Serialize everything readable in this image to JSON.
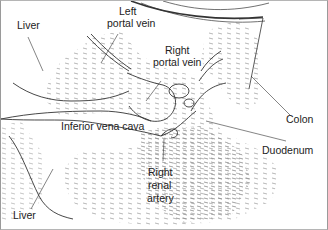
{
  "diagram": {
    "type": "anatomical-line-drawing",
    "colors": {
      "line": "#333333",
      "hatch": "#8a8a8a",
      "background": "#ffffff"
    },
    "labels": {
      "liver_top": "Liver",
      "left_portal_vein_1": "Left",
      "left_portal_vein_2": "portal vein",
      "right_portal_vein_1": "Right",
      "right_portal_vein_2": "portal vein",
      "inferior_vena_cava": "Inferior vena cava",
      "colon": "Colon",
      "duodenum": "Duodenum",
      "right_renal_artery_1": "Right",
      "right_renal_artery_2": "renal",
      "right_renal_artery_3": "artery",
      "liver_bottom": "Liver"
    }
  }
}
